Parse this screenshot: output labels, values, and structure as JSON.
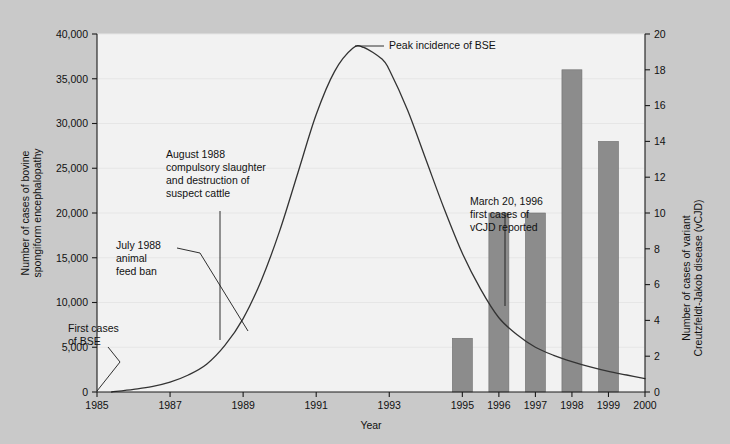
{
  "chart_data": {
    "type": "line",
    "title": "",
    "xlabel": "Year",
    "ylabel": "Number of cases of bovine spongiform encephalopathy",
    "y2label": "Number of cases of variant Creutzfeldt-Jakob disease (vCJD)",
    "xlim": [
      1985,
      2000
    ],
    "ylim": [
      0,
      40000
    ],
    "y2lim": [
      0,
      20
    ],
    "grid": false,
    "legend": "none",
    "x_tick_labels": [
      "1985",
      "1987",
      "1989",
      "1991",
      "1993",
      "1995",
      "1996",
      "1997",
      "1998",
      "1999",
      "2000"
    ],
    "x_tick_values": [
      1985,
      1987,
      1989,
      1991,
      1993,
      1995,
      1996,
      1997,
      1998,
      1999,
      2000
    ],
    "y_tick_labels": [
      "0",
      "5,000",
      "10,000",
      "15,000",
      "20,000",
      "25,000",
      "30,000",
      "35,000",
      "40,000"
    ],
    "y_tick_values": [
      0,
      5000,
      10000,
      15000,
      20000,
      25000,
      30000,
      35000,
      40000
    ],
    "y2_tick_labels": [
      "0",
      "2",
      "4",
      "6",
      "8",
      "10",
      "12",
      "14",
      "16",
      "18",
      "20"
    ],
    "y2_tick_values": [
      0,
      2,
      4,
      6,
      8,
      10,
      12,
      14,
      16,
      18,
      20
    ],
    "series": [
      {
        "name": "Number of cases of bovine spongiform encephalopathy",
        "type": "line",
        "axis": "left",
        "x": [
          1985.4,
          1986,
          1986.5,
          1987,
          1987.5,
          1988,
          1988.5,
          1989,
          1989.5,
          1990,
          1990.5,
          1991,
          1991.5,
          1992,
          1992.3,
          1992.8,
          1993,
          1993.5,
          1994,
          1994.5,
          1995,
          1995.5,
          1996,
          1996.5,
          1997,
          1997.5,
          1998,
          1998.5,
          1999,
          1999.5,
          2000
        ],
        "values": [
          0,
          300,
          600,
          1100,
          1900,
          3100,
          5200,
          8200,
          12500,
          18000,
          24500,
          31000,
          35800,
          38400,
          38500,
          37200,
          36000,
          31500,
          26000,
          20500,
          15500,
          11500,
          8300,
          6400,
          5000,
          4100,
          3400,
          2800,
          2300,
          1900,
          1500
        ]
      },
      {
        "name": "Number of cases of variant Creutzfeldt-Jakob disease (vCJD)",
        "type": "bar",
        "axis": "right",
        "categories": [
          "1995",
          "1996",
          "1997",
          "1998",
          "1999"
        ],
        "x": [
          1995,
          1996,
          1997,
          1998,
          1999
        ],
        "values": [
          3,
          10,
          10,
          18,
          14
        ]
      }
    ],
    "annotations": [
      {
        "id": "first-cases-bse",
        "text_lines": [
          "First cases",
          "of BSE"
        ],
        "text_x": 68,
        "text_y": 332,
        "leader": "M 108 347 L 120 362 L 97 391"
      },
      {
        "id": "july-1988-feed-ban",
        "text_lines": [
          "July 1988",
          "animal",
          "feed ban"
        ],
        "text_x": 116,
        "text_y": 249,
        "leader": "M 177 248 L 200 253 L 248 331"
      },
      {
        "id": "august-1988-slaughter",
        "text_lines": [
          "August 1988",
          "compulsory slaughter",
          "and destruction of",
          "suspect cattle"
        ],
        "text_x": 166,
        "text_y": 158,
        "leader": "M 220 211 L 220 340"
      },
      {
        "id": "peak-incidence-bse",
        "text_lines": [
          "Peak incidence of BSE"
        ],
        "text_x": 389,
        "text_y": 49,
        "leader": "M 384 46 L 355 46"
      },
      {
        "id": "march-1996-first-vcjd",
        "text_lines": [
          "March 20, 1996",
          "first cases of",
          "vCJD reported"
        ],
        "text_x": 470,
        "text_y": 205,
        "leader": "M 505 213 L 505 306"
      }
    ]
  }
}
